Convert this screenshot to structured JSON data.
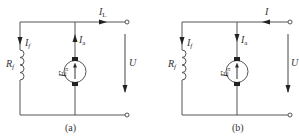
{
  "figure": {
    "line_color": "#555555",
    "circuits": [
      {
        "id": "a",
        "caption": "(a)",
        "line_current": {
          "symbol": "I",
          "subscript": "L",
          "direction": "right"
        },
        "field_current": {
          "symbol": "I",
          "subscript": "f",
          "direction": "down"
        },
        "field_resistance": {
          "symbol": "R",
          "subscript": "f"
        },
        "armature_current": {
          "symbol": "I",
          "subscript": "a",
          "direction": "up"
        },
        "emf": {
          "symbol": "E",
          "subscript": "a"
        },
        "voltage": {
          "symbol": "U",
          "direction": "down"
        }
      },
      {
        "id": "b",
        "caption": "(b)",
        "line_current": {
          "symbol": "I",
          "subscript": "",
          "direction": "left"
        },
        "field_current": {
          "symbol": "I",
          "subscript": "f",
          "direction": "down"
        },
        "field_resistance": {
          "symbol": "R",
          "subscript": "f"
        },
        "armature_current": {
          "symbol": "I",
          "subscript": "a",
          "direction": "down"
        },
        "emf": {
          "symbol": "E",
          "subscript": "a"
        },
        "voltage": {
          "symbol": "U",
          "direction": "down"
        }
      }
    ]
  }
}
